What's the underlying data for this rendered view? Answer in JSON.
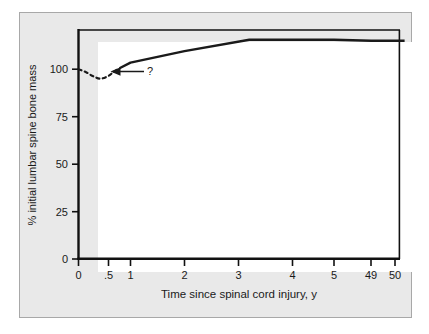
{
  "chart_data": {
    "type": "line",
    "title": "",
    "xlabel": "Time since spinal cord injury, y",
    "ylabel": "% initial lumbar spine bone mass",
    "x_tick_labels": [
      "0",
      ".5",
      "1",
      "2",
      "3",
      "4",
      "5",
      "49",
      "50"
    ],
    "x_tick_values": [
      0,
      0.5,
      1,
      2,
      3,
      4,
      5,
      49,
      50
    ],
    "y_tick_labels": [
      "0",
      "25",
      "50",
      "75",
      "100"
    ],
    "y_tick_values": [
      0,
      25,
      50,
      75,
      100
    ],
    "ylim": [
      0,
      138
    ],
    "grid": false,
    "legend": "none",
    "axis_note": "x axis is non-linear / broken between 5 and 49",
    "series": [
      {
        "name": "acute post-injury bone loss (uncertain)",
        "style": "dashed",
        "color": "#1a1a1a",
        "points": [
          {
            "x": 0.0,
            "y": 100
          },
          {
            "x": 0.12,
            "y": 98.5
          },
          {
            "x": 0.25,
            "y": 96.2
          },
          {
            "x": 0.37,
            "y": 95.0
          },
          {
            "x": 0.5,
            "y": 96.5
          },
          {
            "x": 0.62,
            "y": 98.7
          },
          {
            "x": 0.75,
            "y": 100.5
          }
        ]
      },
      {
        "name": "observed recovery and plateau",
        "style": "solid",
        "color": "#1a1a1a",
        "points": [
          {
            "x": 0.75,
            "y": 100.5
          },
          {
            "x": 1.0,
            "y": 103.5
          },
          {
            "x": 2.0,
            "y": 109.5
          },
          {
            "x": 3.2,
            "y": 115.5
          },
          {
            "x": 5.0,
            "y": 115.5
          },
          {
            "x": 49.0,
            "y": 115.0
          },
          {
            "x": 50.4,
            "y": 115.0
          }
        ]
      }
    ],
    "annotations": [
      {
        "name": "question-mark",
        "text": "?",
        "arrow": "left-pointing arrow from label toward the dashed dip",
        "x": 1.1,
        "y": 95.5
      }
    ]
  }
}
